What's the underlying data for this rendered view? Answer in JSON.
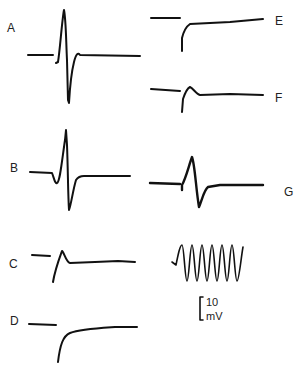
{
  "figure": {
    "panels": [
      {
        "id": "A",
        "label": "A"
      },
      {
        "id": "B",
        "label": "B"
      },
      {
        "id": "C",
        "label": "C"
      },
      {
        "id": "D",
        "label": "D"
      },
      {
        "id": "E",
        "label": "E"
      },
      {
        "id": "F",
        "label": "F"
      },
      {
        "id": "G",
        "label": "G"
      }
    ],
    "calibration": {
      "value": "10",
      "unit": "mV"
    }
  }
}
